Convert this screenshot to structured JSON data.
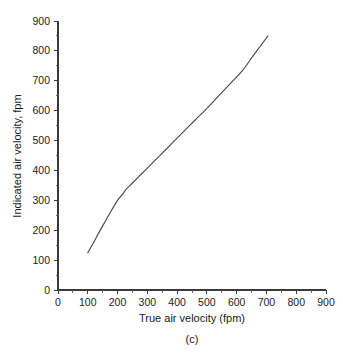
{
  "chart_data": {
    "type": "line",
    "title": "",
    "subtitle": "",
    "caption": "(c)",
    "xlabel": "True air velocity (fpm)",
    "ylabel": "Indicated air velocity, fpm",
    "xlim": [
      0,
      900
    ],
    "ylim": [
      0,
      900
    ],
    "xticks": [
      0,
      100,
      200,
      300,
      400,
      500,
      600,
      700,
      800,
      900
    ],
    "yticks": [
      0,
      100,
      200,
      300,
      400,
      500,
      600,
      700,
      800,
      900
    ],
    "xtick_labels": [
      "0",
      "100",
      "200",
      "300",
      "400",
      "500",
      "600",
      "700",
      "800",
      "900"
    ],
    "ytick_labels": [
      "0",
      "100",
      "200",
      "300",
      "400",
      "500",
      "600",
      "700",
      "800",
      "900"
    ],
    "minor_tick_step": 50,
    "grid": false,
    "legend": null,
    "legend_position": "none",
    "line_color": "#4a4a4a",
    "series": [
      {
        "name": "Indicated vs true air velocity",
        "x": [
          100,
          120,
          140,
          160,
          180,
          200,
          215,
          230,
          250,
          280,
          310,
          340,
          380,
          420,
          460,
          500,
          540,
          580,
          620,
          660,
          705
        ],
        "y": [
          125,
          160,
          197,
          232,
          267,
          300,
          318,
          338,
          358,
          388,
          418,
          448,
          488,
          528,
          568,
          608,
          650,
          692,
          735,
          790,
          850
        ]
      }
    ]
  },
  "figure": {
    "panel_label": "(c)"
  }
}
